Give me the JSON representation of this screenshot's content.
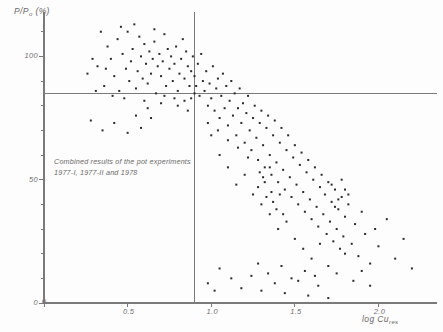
{
  "chart_data": {
    "type": "scatter",
    "title": "",
    "xlabel": "log Cu res",
    "ylabel": "P/P0  (%)",
    "xlim": [
      0,
      2.35
    ],
    "ylim": [
      0,
      118
    ],
    "grid": false,
    "legend": null,
    "xticks": [
      0,
      0.5,
      1.0,
      1.5,
      2.0
    ],
    "xticklabels": [
      "0",
      "0.5",
      "1.0",
      "1.5",
      "2.0"
    ],
    "yticks": [
      0,
      50,
      100
    ],
    "yticklabels": [
      "0",
      "50",
      "100"
    ],
    "y_minor_step": 10,
    "x_minor_step": 0.5,
    "reference_lines": [
      {
        "orientation": "horizontal",
        "value": 85
      },
      {
        "orientation": "vertical",
        "value": 0.9
      }
    ],
    "annotation": {
      "line1": "Combined results of the pot experiments",
      "line2": "1977-I, 1977-II and 1978"
    },
    "marker": {
      "shape": "square",
      "size_px": 2,
      "color": "#2b2b2b"
    },
    "points": [
      [
        0.32,
        96
      ],
      [
        0.36,
        88
      ],
      [
        0.38,
        104
      ],
      [
        0.4,
        99
      ],
      [
        0.42,
        92
      ],
      [
        0.44,
        107
      ],
      [
        0.45,
        86
      ],
      [
        0.47,
        101
      ],
      [
        0.49,
        95
      ],
      [
        0.5,
        110
      ],
      [
        0.51,
        90
      ],
      [
        0.52,
        98
      ],
      [
        0.53,
        103
      ],
      [
        0.55,
        87
      ],
      [
        0.56,
        94
      ],
      [
        0.57,
        108
      ],
      [
        0.58,
        100
      ],
      [
        0.59,
        91
      ],
      [
        0.6,
        105
      ],
      [
        0.61,
        97
      ],
      [
        0.62,
        89
      ],
      [
        0.63,
        102
      ],
      [
        0.64,
        93
      ],
      [
        0.65,
        99
      ],
      [
        0.66,
        106
      ],
      [
        0.67,
        85
      ],
      [
        0.68,
        96
      ],
      [
        0.69,
        101
      ],
      [
        0.7,
        92
      ],
      [
        0.71,
        98
      ],
      [
        0.72,
        109
      ],
      [
        0.73,
        88
      ],
      [
        0.74,
        103
      ],
      [
        0.75,
        95
      ],
      [
        0.76,
        100
      ],
      [
        0.77,
        90
      ],
      [
        0.78,
        97
      ],
      [
        0.79,
        104
      ],
      [
        0.8,
        86
      ],
      [
        0.81,
        93
      ],
      [
        0.82,
        99
      ],
      [
        0.83,
        107
      ],
      [
        0.84,
        91
      ],
      [
        0.85,
        102
      ],
      [
        0.86,
        96
      ],
      [
        0.87,
        88
      ],
      [
        0.88,
        94
      ],
      [
        0.89,
        100
      ],
      [
        0.9,
        85
      ],
      [
        0.26,
        93
      ],
      [
        0.29,
        99
      ],
      [
        0.31,
        86
      ],
      [
        0.34,
        110
      ],
      [
        0.37,
        95
      ],
      [
        0.41,
        84
      ],
      [
        0.46,
        112
      ],
      [
        0.48,
        83
      ],
      [
        0.54,
        113
      ],
      [
        0.6,
        82
      ],
      [
        0.66,
        111
      ],
      [
        0.72,
        84
      ],
      [
        0.78,
        83
      ],
      [
        0.84,
        82
      ],
      [
        0.55,
        76
      ],
      [
        0.62,
        79
      ],
      [
        0.7,
        81
      ],
      [
        0.8,
        80
      ],
      [
        0.86,
        78
      ],
      [
        0.88,
        83
      ],
      [
        0.9,
        92
      ],
      [
        0.91,
        88
      ],
      [
        0.92,
        97
      ],
      [
        0.93,
        84
      ],
      [
        0.94,
        101
      ],
      [
        0.95,
        90
      ],
      [
        0.96,
        86
      ],
      [
        0.97,
        94
      ],
      [
        0.98,
        80
      ],
      [
        0.99,
        89
      ],
      [
        1.0,
        83
      ],
      [
        1.01,
        96
      ],
      [
        1.02,
        78
      ],
      [
        1.03,
        87
      ],
      [
        1.04,
        91
      ],
      [
        1.05,
        75
      ],
      [
        1.06,
        84
      ],
      [
        1.07,
        93
      ],
      [
        1.08,
        79
      ],
      [
        1.09,
        88
      ],
      [
        1.1,
        72
      ],
      [
        1.11,
        82
      ],
      [
        1.12,
        90
      ],
      [
        1.13,
        76
      ],
      [
        1.14,
        85
      ],
      [
        1.15,
        68
      ],
      [
        1.16,
        79
      ],
      [
        1.17,
        87
      ],
      [
        1.18,
        73
      ],
      [
        1.19,
        81
      ],
      [
        1.2,
        65
      ],
      [
        1.21,
        77
      ],
      [
        1.22,
        84
      ],
      [
        1.23,
        70
      ],
      [
        1.24,
        62
      ],
      [
        1.25,
        75
      ],
      [
        1.26,
        80
      ],
      [
        1.27,
        67
      ],
      [
        1.28,
        58
      ],
      [
        1.29,
        73
      ],
      [
        1.3,
        78
      ],
      [
        1.31,
        64
      ],
      [
        1.32,
        55
      ],
      [
        1.33,
        71
      ],
      [
        1.34,
        76
      ],
      [
        1.35,
        60
      ],
      [
        1.36,
        52
      ],
      [
        1.37,
        68
      ],
      [
        1.38,
        74
      ],
      [
        1.39,
        57
      ],
      [
        1.4,
        49
      ],
      [
        1.41,
        65
      ],
      [
        1.42,
        71
      ],
      [
        1.43,
        54
      ],
      [
        1.44,
        46
      ],
      [
        1.45,
        62
      ],
      [
        1.46,
        68
      ],
      [
        1.47,
        51
      ],
      [
        1.48,
        43
      ],
      [
        1.49,
        59
      ],
      [
        1.5,
        64
      ],
      [
        1.51,
        48
      ],
      [
        1.52,
        40
      ],
      [
        1.53,
        56
      ],
      [
        1.54,
        61
      ],
      [
        1.55,
        45
      ],
      [
        1.56,
        37
      ],
      [
        1.57,
        53
      ],
      [
        1.58,
        58
      ],
      [
        1.59,
        42
      ],
      [
        1.6,
        34
      ],
      [
        1.61,
        50
      ],
      [
        1.62,
        55
      ],
      [
        1.63,
        39
      ],
      [
        1.64,
        31
      ],
      [
        1.65,
        47
      ],
      [
        1.66,
        52
      ],
      [
        1.67,
        36
      ],
      [
        1.68,
        44
      ],
      [
        1.69,
        28
      ],
      [
        1.7,
        49
      ],
      [
        1.71,
        33
      ],
      [
        1.72,
        41
      ],
      [
        1.73,
        25
      ],
      [
        1.74,
        46
      ],
      [
        1.75,
        30
      ],
      [
        1.76,
        38
      ],
      [
        1.77,
        22
      ],
      [
        1.78,
        43
      ],
      [
        1.79,
        27
      ],
      [
        1.8,
        35
      ],
      [
        1.82,
        40
      ],
      [
        1.84,
        24
      ],
      [
        1.86,
        32
      ],
      [
        1.88,
        19
      ],
      [
        1.9,
        37
      ],
      [
        1.92,
        28
      ],
      [
        1.95,
        16
      ],
      [
        1.98,
        30
      ],
      [
        2.0,
        23
      ],
      [
        2.05,
        34
      ],
      [
        2.1,
        18
      ],
      [
        2.15,
        26
      ],
      [
        2.2,
        14
      ],
      [
        1.0,
        68
      ],
      [
        1.05,
        60
      ],
      [
        1.1,
        55
      ],
      [
        1.15,
        48
      ],
      [
        1.2,
        52
      ],
      [
        1.25,
        44
      ],
      [
        1.3,
        40
      ],
      [
        1.35,
        36
      ],
      [
        1.4,
        30
      ],
      [
        1.45,
        33
      ],
      [
        1.5,
        26
      ],
      [
        1.55,
        22
      ],
      [
        1.6,
        18
      ],
      [
        1.65,
        24
      ],
      [
        1.7,
        15
      ],
      [
        1.75,
        12
      ],
      [
        1.8,
        20
      ],
      [
        1.85,
        9
      ],
      [
        1.9,
        13
      ],
      [
        1.95,
        7
      ],
      [
        1.12,
        10
      ],
      [
        1.18,
        6
      ],
      [
        1.24,
        11
      ],
      [
        1.3,
        5
      ],
      [
        1.38,
        8
      ],
      [
        1.44,
        4
      ],
      [
        1.52,
        9
      ],
      [
        1.58,
        3
      ],
      [
        1.64,
        7
      ],
      [
        1.7,
        2
      ],
      [
        1.05,
        14
      ],
      [
        0.98,
        8
      ],
      [
        1.02,
        5
      ],
      [
        1.28,
        16
      ],
      [
        1.34,
        12
      ],
      [
        1.42,
        15
      ],
      [
        1.48,
        10
      ],
      [
        1.56,
        13
      ],
      [
        1.62,
        11
      ],
      [
        1.28,
        47
      ],
      [
        1.32,
        49
      ],
      [
        1.36,
        45
      ],
      [
        1.31,
        51
      ],
      [
        1.33,
        43
      ],
      [
        1.29,
        53
      ],
      [
        1.37,
        41
      ],
      [
        1.35,
        55
      ],
      [
        1.39,
        38
      ],
      [
        1.41,
        44
      ],
      [
        1.43,
        36
      ],
      [
        1.72,
        48
      ],
      [
        1.76,
        42
      ],
      [
        1.8,
        46
      ],
      [
        1.74,
        39
      ],
      [
        1.78,
        50
      ],
      [
        1.82,
        44
      ],
      [
        0.28,
        74
      ],
      [
        0.35,
        70
      ],
      [
        0.42,
        73
      ],
      [
        0.5,
        69
      ],
      [
        0.58,
        71
      ],
      [
        0.64,
        75
      ],
      [
        0.98,
        73
      ],
      [
        1.04,
        70
      ],
      [
        1.1,
        66
      ],
      [
        1.16,
        63
      ],
      [
        1.22,
        59
      ]
    ]
  }
}
